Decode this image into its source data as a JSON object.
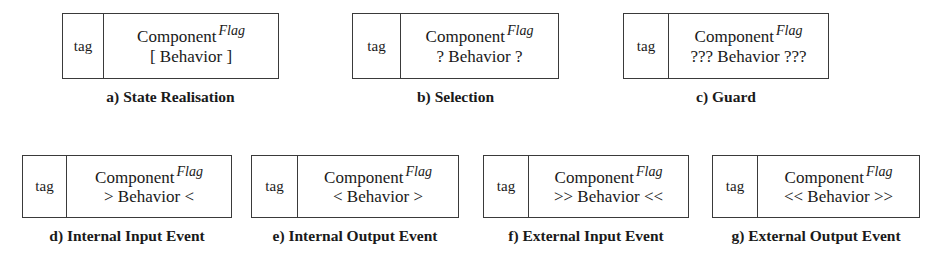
{
  "figure": {
    "tag_label": "tag",
    "component_label": "Component",
    "flag_label": "Flag",
    "items": [
      {
        "id": "a",
        "tag": "tag",
        "component": "Component",
        "flag": "Flag",
        "behavior": "[ Behavior ]",
        "caption": "a) State Realisation"
      },
      {
        "id": "b",
        "tag": "tag",
        "component": "Component",
        "flag": "Flag",
        "behavior": "? Behavior ?",
        "caption": "b) Selection"
      },
      {
        "id": "c",
        "tag": "tag",
        "component": "Component",
        "flag": "Flag",
        "behavior": "??? Behavior ???",
        "caption": "c) Guard"
      },
      {
        "id": "d",
        "tag": "tag",
        "component": "Component",
        "flag": "Flag",
        "behavior": "> Behavior <",
        "caption": "d) Internal Input Event"
      },
      {
        "id": "e",
        "tag": "tag",
        "component": "Component",
        "flag": "Flag",
        "behavior": "< Behavior >",
        "caption": "e) Internal Output Event"
      },
      {
        "id": "f",
        "tag": "tag",
        "component": "Component",
        "flag": "Flag",
        "behavior": ">> Behavior <<",
        "caption": "f) External Input Event"
      },
      {
        "id": "g",
        "tag": "tag",
        "component": "Component",
        "flag": "Flag",
        "behavior": "<< Behavior >>",
        "caption": "g) External Output Event"
      }
    ]
  },
  "colors": {
    "border": "#3a3a3a",
    "text": "#1a1a1a",
    "background": "#ffffff"
  }
}
